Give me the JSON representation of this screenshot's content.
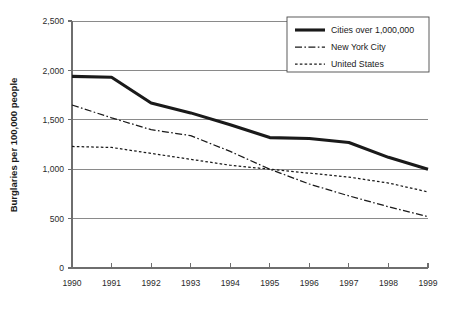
{
  "chart_data": {
    "type": "line",
    "title": "",
    "xlabel": "",
    "ylabel": "Burglaries per 100,000 people",
    "x": [
      1990,
      1991,
      1992,
      1993,
      1994,
      1995,
      1996,
      1997,
      1998,
      1999
    ],
    "xtick_labels": [
      "1990",
      "1991",
      "1992",
      "1993",
      "1994",
      "1995",
      "1996",
      "1997",
      "1998",
      "1999"
    ],
    "ytick_labels": [
      "0",
      "500",
      "1,000",
      "1,500",
      "2,000",
      "2,500"
    ],
    "ytick_values": [
      0,
      500,
      1000,
      1500,
      2000,
      2500
    ],
    "ylim": [
      0,
      2500
    ],
    "xlim": [
      1990,
      1999
    ],
    "grid": "horizontal",
    "legend_position": "top-right",
    "series": [
      {
        "name": "Cities over 1,000,000",
        "style": "solid-thick",
        "color": "#1a1a1a",
        "values": [
          1940,
          1930,
          1670,
          1570,
          1450,
          1320,
          1310,
          1270,
          1120,
          1000
        ]
      },
      {
        "name": "New York City",
        "style": "dash-dot",
        "color": "#1a1a1a",
        "values": [
          1650,
          1520,
          1400,
          1340,
          1180,
          1000,
          850,
          730,
          620,
          520
        ]
      },
      {
        "name": "United States",
        "style": "dotted",
        "color": "#1a1a1a",
        "values": [
          1230,
          1220,
          1160,
          1100,
          1040,
          1000,
          960,
          920,
          860,
          770
        ]
      }
    ]
  },
  "axes": {
    "y_title": "Burglaries per 100,000 people"
  },
  "legend": {
    "items": [
      {
        "label": "Cities over 1,000,000"
      },
      {
        "label": "New York City"
      },
      {
        "label": "United States"
      }
    ]
  }
}
